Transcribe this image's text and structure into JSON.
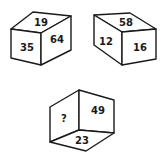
{
  "puzzle": {
    "cubes": [
      {
        "top": "19",
        "front": "35",
        "right": "64"
      },
      {
        "top": "58",
        "left": "12",
        "front": "16"
      },
      {
        "left": "?",
        "right": "49",
        "bottom": "23"
      }
    ]
  },
  "colors": {
    "line": "#1a1a1a",
    "background": "#ffffff"
  }
}
